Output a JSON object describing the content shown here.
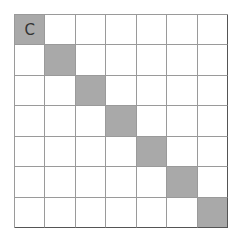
{
  "board": {
    "rows": 7,
    "cols": 7,
    "shade_color": "#a9a9a9",
    "line_color": "#9a9a9a",
    "cells": [
      [
        {
          "text": "C",
          "shaded": true
        },
        {
          "text": "",
          "shaded": false
        },
        {
          "text": "",
          "shaded": false
        },
        {
          "text": "",
          "shaded": false
        },
        {
          "text": "",
          "shaded": false
        },
        {
          "text": "",
          "shaded": false
        },
        {
          "text": "",
          "shaded": false
        }
      ],
      [
        {
          "text": "",
          "shaded": false
        },
        {
          "text": "",
          "shaded": true
        },
        {
          "text": "",
          "shaded": false
        },
        {
          "text": "",
          "shaded": false
        },
        {
          "text": "",
          "shaded": false
        },
        {
          "text": "",
          "shaded": false
        },
        {
          "text": "",
          "shaded": false
        }
      ],
      [
        {
          "text": "",
          "shaded": false
        },
        {
          "text": "",
          "shaded": false
        },
        {
          "text": "",
          "shaded": true
        },
        {
          "text": "",
          "shaded": false
        },
        {
          "text": "",
          "shaded": false
        },
        {
          "text": "",
          "shaded": false
        },
        {
          "text": "",
          "shaded": false
        }
      ],
      [
        {
          "text": "",
          "shaded": false
        },
        {
          "text": "",
          "shaded": false
        },
        {
          "text": "",
          "shaded": false
        },
        {
          "text": "",
          "shaded": true
        },
        {
          "text": "",
          "shaded": false
        },
        {
          "text": "",
          "shaded": false
        },
        {
          "text": "",
          "shaded": false
        }
      ],
      [
        {
          "text": "",
          "shaded": false
        },
        {
          "text": "",
          "shaded": false
        },
        {
          "text": "",
          "shaded": false
        },
        {
          "text": "",
          "shaded": false
        },
        {
          "text": "",
          "shaded": true
        },
        {
          "text": "",
          "shaded": false
        },
        {
          "text": "",
          "shaded": false
        }
      ],
      [
        {
          "text": "",
          "shaded": false
        },
        {
          "text": "",
          "shaded": false
        },
        {
          "text": "",
          "shaded": false
        },
        {
          "text": "",
          "shaded": false
        },
        {
          "text": "",
          "shaded": false
        },
        {
          "text": "",
          "shaded": true
        },
        {
          "text": "",
          "shaded": false
        }
      ],
      [
        {
          "text": "",
          "shaded": false
        },
        {
          "text": "",
          "shaded": false
        },
        {
          "text": "",
          "shaded": false
        },
        {
          "text": "",
          "shaded": false
        },
        {
          "text": "",
          "shaded": false
        },
        {
          "text": "",
          "shaded": false
        },
        {
          "text": "",
          "shaded": true
        }
      ]
    ]
  }
}
